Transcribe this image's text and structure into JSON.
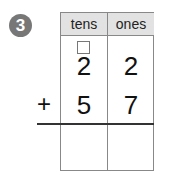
{
  "problem_number": "3",
  "table": {
    "headers": [
      "tens",
      "ones"
    ],
    "carry_box": "",
    "rows": [
      {
        "operator": "",
        "tens": "2",
        "ones": "2"
      },
      {
        "operator": "+",
        "tens": "5",
        "ones": "7"
      }
    ],
    "answer": {
      "tens": "",
      "ones": ""
    }
  }
}
